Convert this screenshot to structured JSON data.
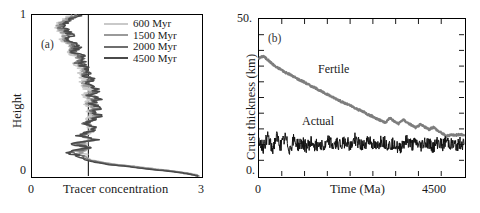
{
  "figure": {
    "panels": [
      {
        "tag": "(a)",
        "xlabel": "Tracer concentration",
        "ylabel": "Height",
        "xticks": [
          "0",
          "3"
        ],
        "yticks": [
          "1",
          "0"
        ],
        "xlim": [
          0,
          3
        ],
        "ylim": [
          0,
          1
        ],
        "reference_line_x": 1,
        "legend": [
          {
            "label": "600 Myr",
            "color": "#c9c9c9"
          },
          {
            "label": "1500 Myr",
            "color": "#9a9a9a"
          },
          {
            "label": "2000 Myr",
            "color": "#6e6e6e"
          },
          {
            "label": "4500 Myr",
            "color": "#4a4a4a"
          }
        ]
      },
      {
        "tag": "(b)",
        "xlabel": "Time (Ma)",
        "ylabel": "Crust thickness (km)",
        "xticks": [
          "0",
          "4500"
        ],
        "yticks": [
          "50.",
          "0."
        ],
        "xlim": [
          0,
          4700
        ],
        "ylim": [
          0,
          50
        ],
        "annotations": [
          {
            "text": "Fertile",
            "color": "#7d7d7d"
          },
          {
            "text": "Actual",
            "color": "#111111"
          }
        ]
      }
    ]
  },
  "chart_data": [
    {
      "type": "line",
      "panel": "(a)",
      "title": "",
      "xlabel": "Tracer concentration",
      "ylabel": "Height",
      "xlim": [
        0,
        3
      ],
      "ylim": [
        0,
        1
      ],
      "grid": false,
      "orientation": "profile-vertical",
      "legend_position": "upper-right-inside",
      "annotations": [
        "(a)"
      ],
      "reference_lines": [
        {
          "type": "vertical",
          "x": 1
        }
      ],
      "series": [
        {
          "name": "600 Myr",
          "color": "#c9c9c9",
          "y": [
            1.0,
            0.975,
            0.95,
            0.925,
            0.9,
            0.875,
            0.85,
            0.825,
            0.8,
            0.775,
            0.75,
            0.725,
            0.7,
            0.675,
            0.65,
            0.625,
            0.6,
            0.575,
            0.55,
            0.525,
            0.5,
            0.475,
            0.45,
            0.425,
            0.4,
            0.375,
            0.35,
            0.325,
            0.3,
            0.275,
            0.25,
            0.225,
            0.2,
            0.175,
            0.15,
            0.125,
            0.1,
            0.085,
            0.07,
            0.06,
            0.05,
            0.04,
            0.03,
            0.02,
            0.01,
            0.0
          ],
          "x": [
            0.72,
            0.6,
            0.5,
            0.46,
            0.52,
            0.58,
            0.55,
            0.62,
            0.7,
            0.66,
            0.74,
            0.8,
            0.76,
            0.84,
            0.9,
            0.86,
            0.94,
            0.88,
            0.96,
            1.02,
            0.95,
            1.04,
            0.98,
            1.06,
            1.0,
            1.08,
            1.02,
            0.96,
            1.05,
            1.0,
            0.94,
            1.02,
            0.92,
            0.98,
            0.88,
            0.95,
            1.05,
            1.25,
            1.55,
            1.85,
            2.05,
            2.3,
            2.55,
            2.75,
            2.9,
            2.97
          ]
        },
        {
          "name": "1500 Myr",
          "color": "#9a9a9a",
          "y": [
            1.0,
            0.975,
            0.95,
            0.925,
            0.9,
            0.875,
            0.85,
            0.825,
            0.8,
            0.775,
            0.75,
            0.725,
            0.7,
            0.675,
            0.65,
            0.625,
            0.6,
            0.575,
            0.55,
            0.525,
            0.5,
            0.475,
            0.45,
            0.425,
            0.4,
            0.375,
            0.35,
            0.325,
            0.3,
            0.275,
            0.25,
            0.225,
            0.2,
            0.175,
            0.15,
            0.125,
            0.1,
            0.085,
            0.07,
            0.06,
            0.05,
            0.04,
            0.03,
            0.02,
            0.01,
            0.0
          ],
          "x": [
            0.78,
            0.64,
            0.55,
            0.48,
            0.56,
            0.63,
            0.58,
            0.68,
            0.74,
            0.7,
            0.8,
            0.86,
            0.8,
            0.9,
            0.96,
            0.9,
            1.0,
            0.93,
            1.02,
            1.08,
            1.0,
            1.1,
            1.02,
            1.12,
            1.05,
            1.14,
            1.06,
            0.98,
            1.1,
            1.02,
            0.92,
            1.06,
            0.86,
            1.0,
            0.82,
            0.92,
            1.02,
            1.22,
            1.5,
            1.8,
            2.02,
            2.26,
            2.52,
            2.72,
            2.88,
            2.96
          ]
        },
        {
          "name": "2000 Myr",
          "color": "#6e6e6e",
          "y": [
            1.0,
            0.975,
            0.95,
            0.925,
            0.9,
            0.875,
            0.85,
            0.825,
            0.8,
            0.775,
            0.75,
            0.725,
            0.7,
            0.675,
            0.65,
            0.625,
            0.6,
            0.575,
            0.55,
            0.525,
            0.5,
            0.475,
            0.45,
            0.425,
            0.4,
            0.375,
            0.35,
            0.325,
            0.3,
            0.275,
            0.25,
            0.225,
            0.2,
            0.175,
            0.15,
            0.125,
            0.1,
            0.085,
            0.07,
            0.06,
            0.05,
            0.04,
            0.03,
            0.02,
            0.01,
            0.0
          ],
          "x": [
            0.82,
            0.68,
            0.56,
            0.5,
            0.6,
            0.66,
            0.6,
            0.72,
            0.78,
            0.72,
            0.84,
            0.9,
            0.82,
            0.94,
            1.0,
            0.92,
            1.04,
            0.96,
            1.06,
            1.12,
            1.02,
            1.14,
            1.04,
            1.16,
            1.08,
            1.18,
            1.08,
            0.96,
            1.14,
            1.0,
            0.86,
            1.1,
            0.78,
            1.02,
            0.72,
            0.86,
            1.0,
            1.18,
            1.44,
            1.74,
            1.96,
            2.2,
            2.46,
            2.68,
            2.85,
            2.95
          ]
        },
        {
          "name": "4500 Myr",
          "color": "#4a4a4a",
          "y": [
            1.0,
            0.975,
            0.95,
            0.925,
            0.9,
            0.875,
            0.85,
            0.825,
            0.8,
            0.775,
            0.75,
            0.725,
            0.7,
            0.675,
            0.65,
            0.625,
            0.6,
            0.575,
            0.55,
            0.525,
            0.5,
            0.475,
            0.45,
            0.425,
            0.4,
            0.375,
            0.35,
            0.325,
            0.3,
            0.275,
            0.25,
            0.225,
            0.2,
            0.175,
            0.15,
            0.125,
            0.1,
            0.085,
            0.07,
            0.06,
            0.05,
            0.04,
            0.03,
            0.02,
            0.01,
            0.0
          ],
          "x": [
            0.86,
            0.7,
            0.58,
            0.52,
            0.62,
            0.7,
            0.62,
            0.76,
            0.82,
            0.74,
            0.88,
            0.94,
            0.84,
            0.98,
            1.04,
            0.94,
            1.08,
            0.98,
            1.1,
            1.16,
            1.04,
            1.18,
            1.06,
            1.2,
            1.1,
            1.22,
            1.1,
            0.94,
            1.18,
            0.98,
            0.8,
            1.14,
            0.7,
            1.04,
            0.64,
            0.8,
            0.96,
            1.12,
            1.38,
            1.68,
            1.9,
            2.14,
            2.42,
            2.64,
            2.82,
            2.94
          ]
        }
      ]
    },
    {
      "type": "line",
      "panel": "(b)",
      "title": "",
      "xlabel": "Time (Ma)",
      "ylabel": "Crust thickness (km)",
      "xlim": [
        0,
        4700
      ],
      "ylim": [
        0,
        50
      ],
      "grid": false,
      "annotations": [
        "(b)",
        "Fertile",
        "Actual"
      ],
      "x": [
        0,
        100,
        200,
        300,
        400,
        500,
        600,
        700,
        800,
        900,
        1000,
        1100,
        1200,
        1300,
        1400,
        1500,
        1600,
        1700,
        1800,
        1900,
        2000,
        2100,
        2200,
        2300,
        2400,
        2500,
        2600,
        2700,
        2800,
        2900,
        3000,
        3100,
        3200,
        3300,
        3400,
        3500,
        3600,
        3700,
        3800,
        3900,
        4000,
        4100,
        4200,
        4300,
        4400,
        4500,
        4600,
        4700
      ],
      "series": [
        {
          "name": "Fertile",
          "color": "#7d7d7d",
          "values": [
            37.5,
            38.2,
            37.0,
            35.8,
            34.6,
            34.0,
            33.0,
            32.4,
            31.6,
            30.8,
            30.2,
            29.4,
            28.6,
            28.0,
            27.2,
            26.4,
            25.8,
            25.0,
            24.4,
            23.6,
            23.0,
            22.4,
            21.6,
            21.0,
            20.4,
            19.6,
            19.0,
            18.2,
            17.6,
            17.0,
            18.6,
            17.4,
            16.6,
            18.0,
            17.0,
            16.2,
            15.4,
            16.4,
            15.6,
            14.8,
            15.6,
            14.4,
            13.6,
            12.6,
            13.2,
            13.0,
            13.2,
            13.1
          ]
        },
        {
          "name": "Actual",
          "color": "#111111",
          "values": [
            11.5,
            9.0,
            13.0,
            8.0,
            12.5,
            9.5,
            12.0,
            8.5,
            11.5,
            9.8,
            10.5,
            9.2,
            11.0,
            9.6,
            10.8,
            9.0,
            11.2,
            9.4,
            10.6,
            9.8,
            11.6,
            9.2,
            12.0,
            10.0,
            9.4,
            11.8,
            10.2,
            9.0,
            11.4,
            10.6,
            9.6,
            11.0,
            8.2,
            10.4,
            11.2,
            9.8,
            10.6,
            9.4,
            11.0,
            10.2,
            9.2,
            10.8,
            9.8,
            11.2,
            10.0,
            9.6,
            10.4,
            10.0
          ]
        }
      ]
    }
  ]
}
